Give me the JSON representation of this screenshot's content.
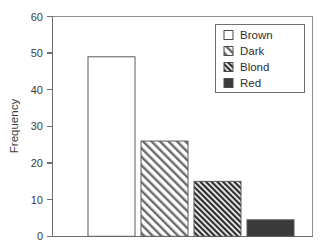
{
  "chart_data": {
    "type": "bar",
    "title": "",
    "xlabel": "",
    "ylabel": "Frequency",
    "categories": [
      "Brown",
      "Dark",
      "Blond",
      "Red"
    ],
    "values": [
      49,
      26,
      15,
      4.5
    ],
    "ylim": [
      0,
      60
    ],
    "yticks": [
      0,
      10,
      20,
      30,
      40,
      50,
      60
    ],
    "ytick_labels": [
      "0",
      "10",
      "20",
      "30",
      "40",
      "50",
      "60"
    ],
    "xticks_visible": false,
    "grid": false,
    "legend_position": "top-right",
    "series": [
      {
        "name": "Brown",
        "value": 49,
        "fill": "none",
        "pattern": "empty"
      },
      {
        "name": "Dark",
        "value": 26,
        "fill": "#ffffff",
        "pattern": "diagonal-light"
      },
      {
        "name": "Blond",
        "value": 15,
        "fill": "#ffffff",
        "pattern": "diagonal-dense"
      },
      {
        "name": "Red",
        "value": 4.5,
        "fill": "#3a3a3a",
        "pattern": "solid"
      }
    ],
    "colors": {
      "axis": "#6f6f6f",
      "frame": "#8d8d8d",
      "text": "#3b3b3b",
      "bar_outline": "#5a5a5a",
      "solid_fill": "#3a3a3a",
      "hatch": "#4a4a4a",
      "background": "#ffffff"
    }
  },
  "axis": {
    "y_title": "Frequency",
    "y_labels": [
      "60",
      "50",
      "40",
      "30",
      "20",
      "10",
      "0"
    ]
  },
  "legend": {
    "items": [
      {
        "label": "Brown"
      },
      {
        "label": "Dark"
      },
      {
        "label": "Blond"
      },
      {
        "label": "Red"
      }
    ]
  }
}
